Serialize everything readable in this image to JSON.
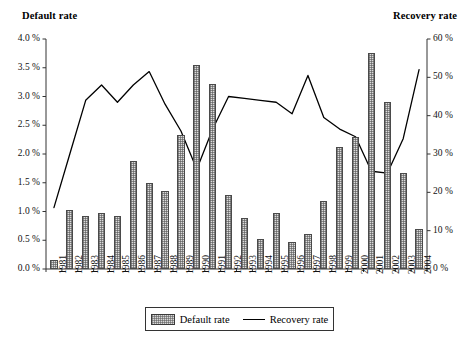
{
  "chart_data": {
    "type": "bar",
    "title": "",
    "xlabel": "",
    "ylabel": "Default rate",
    "y2label": "Recovery rate",
    "ylim": [
      0,
      4.0
    ],
    "y2lim": [
      0,
      60
    ],
    "grid": false,
    "legend_position": "bottom-center",
    "categories": [
      "1981",
      "1982",
      "1983",
      "1984",
      "1985",
      "1986",
      "1987",
      "1988",
      "1989",
      "1990",
      "1991",
      "1992",
      "1993",
      "1994",
      "1995",
      "1996",
      "1997",
      "1998",
      "1999",
      "2000",
      "2001",
      "2002",
      "2003",
      "2004"
    ],
    "left_tick_labels": [
      "4.0 %",
      "3.5 %",
      "3.0 %",
      "2.5 %",
      "2.0 %",
      "1.5 %",
      "1.0 %",
      "0.5 %",
      "0.0 %"
    ],
    "left_tick_values": [
      4.0,
      3.5,
      3.0,
      2.5,
      2.0,
      1.5,
      1.0,
      0.5,
      0.0
    ],
    "right_tick_labels": [
      "60 %",
      "50 %",
      "40 %",
      "30 %",
      "20 %",
      "10 %",
      "0 %"
    ],
    "right_tick_values": [
      60,
      50,
      40,
      30,
      20,
      10,
      0
    ],
    "series": [
      {
        "name": "Default rate",
        "type": "bar",
        "axis": "left",
        "unit": "%",
        "values": [
          0.15,
          1.02,
          0.93,
          0.97,
          0.93,
          1.88,
          1.49,
          1.35,
          2.33,
          3.55,
          3.21,
          1.28,
          0.88,
          0.53,
          0.98,
          0.47,
          0.61,
          1.18,
          2.12,
          2.3,
          3.76,
          2.91,
          1.67,
          0.7
        ]
      },
      {
        "name": "Recovery rate",
        "type": "line",
        "axis": "right",
        "unit": "%",
        "values": [
          16.0,
          30.0,
          44.0,
          48.0,
          43.5,
          48.0,
          51.5,
          43.0,
          36.0,
          26.0,
          36.5,
          45.0,
          44.5,
          44.0,
          43.5,
          40.5,
          50.5,
          39.5,
          36.5,
          34.5,
          25.5,
          25.0,
          34.0,
          52.0
        ]
      }
    ]
  },
  "legend": {
    "items": [
      {
        "label": "Default rate",
        "marker": "bar-swatch"
      },
      {
        "label": "Recovery rate",
        "marker": "line-swatch"
      }
    ]
  },
  "colors": {
    "axis": "#333333",
    "line": "#000000",
    "bar_fill": "#dcdcdc",
    "bar_edge": "#4a4a4a",
    "text": "#000000",
    "background": "#ffffff"
  }
}
